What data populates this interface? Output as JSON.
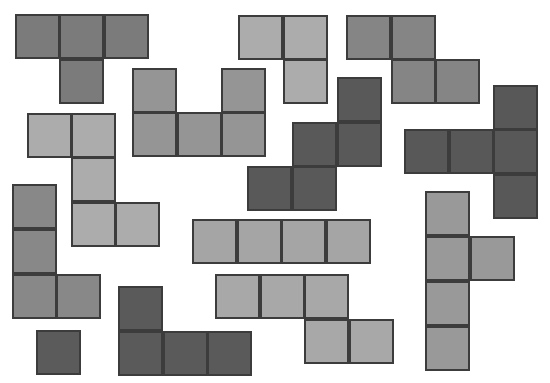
{
  "canvas": {
    "width": 550,
    "height": 383,
    "background": "#ffffff",
    "cell_size": 45,
    "border_color": "#3c3c3c"
  },
  "pieces": [
    {
      "name": "t-tetromino",
      "color": "#7b7b7b",
      "cells": [
        [
          15,
          14
        ],
        [
          59,
          14
        ],
        [
          104,
          14
        ],
        [
          59,
          59
        ]
      ]
    },
    {
      "name": "l-tromino",
      "color": "#acacac",
      "cells": [
        [
          238,
          15
        ],
        [
          283,
          15
        ],
        [
          283,
          59
        ]
      ]
    },
    {
      "name": "z-tetromino",
      "color": "#858585",
      "cells": [
        [
          346,
          15
        ],
        [
          391,
          15
        ],
        [
          391,
          59
        ],
        [
          435,
          59
        ]
      ]
    },
    {
      "name": "u-pentomino",
      "color": "#959595",
      "cells": [
        [
          132,
          68
        ],
        [
          221,
          68
        ],
        [
          132,
          112
        ],
        [
          177,
          112
        ],
        [
          221,
          112
        ]
      ]
    },
    {
      "name": "z-pentomino",
      "color": "#acacac",
      "cells": [
        [
          27,
          113
        ],
        [
          71,
          113
        ],
        [
          71,
          157
        ],
        [
          71,
          202
        ],
        [
          115,
          202
        ]
      ]
    },
    {
      "name": "w-pentomino",
      "color": "#595959",
      "cells": [
        [
          337,
          77
        ],
        [
          292,
          122
        ],
        [
          337,
          122
        ],
        [
          247,
          166
        ],
        [
          292,
          166
        ]
      ]
    },
    {
      "name": "t-pentomino",
      "color": "#585858",
      "cells": [
        [
          493,
          85
        ],
        [
          404,
          129
        ],
        [
          449,
          129
        ],
        [
          493,
          129
        ],
        [
          493,
          174
        ]
      ]
    },
    {
      "name": "l-tetromino",
      "color": "#888888",
      "cells": [
        [
          12,
          184
        ],
        [
          12,
          229
        ],
        [
          12,
          274
        ],
        [
          56,
          274
        ]
      ]
    },
    {
      "name": "i-tetromino",
      "color": "#a5a5a5",
      "cells": [
        [
          192,
          219
        ],
        [
          237,
          219
        ],
        [
          281,
          219
        ],
        [
          326,
          219
        ]
      ]
    },
    {
      "name": "n-pentomino",
      "color": "#a8a8a8",
      "cells": [
        [
          215,
          274
        ],
        [
          260,
          274
        ],
        [
          304,
          274
        ],
        [
          304,
          319
        ],
        [
          349,
          319
        ]
      ]
    },
    {
      "name": "y-pentomino",
      "color": "#999999",
      "cells": [
        [
          425,
          191
        ],
        [
          425,
          236
        ],
        [
          470,
          236
        ],
        [
          425,
          281
        ],
        [
          425,
          326
        ]
      ]
    },
    {
      "name": "j-tetromino",
      "color": "#5a5a5a",
      "cells": [
        [
          118,
          286
        ],
        [
          118,
          331
        ],
        [
          163,
          331
        ],
        [
          207,
          331
        ]
      ]
    },
    {
      "name": "monomino",
      "color": "#5b5b5b",
      "cells": [
        [
          36,
          330
        ]
      ]
    }
  ]
}
